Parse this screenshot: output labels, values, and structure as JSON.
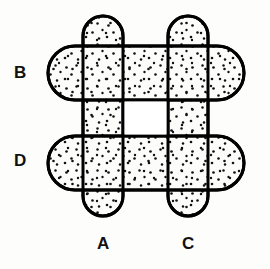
{
  "figure": {
    "type": "overlapping-stadium-bars-diagram",
    "background_color": "#fdfdfb",
    "stroke_color": "#000000",
    "fill_color": "#fcfcfa",
    "stipple_dot_color": "#111111",
    "stroke_width": 3,
    "center_hole_color": "#ffffff",
    "labels": {
      "left_upper": "B",
      "left_lower": "D",
      "bottom_left": "A",
      "bottom_right": "C"
    },
    "bars": [
      {
        "name": "A",
        "orientation": "vertical",
        "label": "A",
        "x": 83,
        "y": 16,
        "width": 40,
        "height": 200,
        "radius": 20
      },
      {
        "name": "C",
        "orientation": "vertical",
        "label": "C",
        "x": 168,
        "y": 16,
        "width": 40,
        "height": 200,
        "radius": 20
      },
      {
        "name": "B",
        "orientation": "horizontal",
        "label": "B",
        "x": 48,
        "y": 46,
        "width": 196,
        "height": 54,
        "radius": 27
      },
      {
        "name": "D",
        "orientation": "horizontal",
        "label": "D",
        "x": 48,
        "y": 136,
        "width": 196,
        "height": 54,
        "radius": 27
      }
    ],
    "center_hole": {
      "name": "center-opening",
      "x": 123,
      "y": 100,
      "width": 45,
      "height": 36
    }
  }
}
